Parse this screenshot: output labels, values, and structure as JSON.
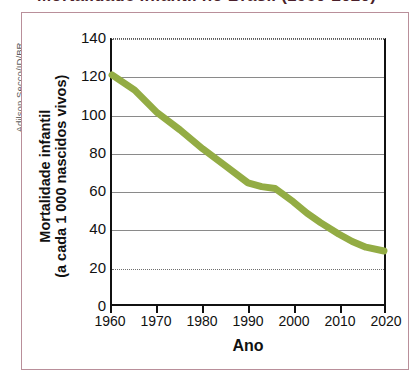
{
  "figure": {
    "credit": "Adilson Secco/ID/BR",
    "title_clipped": "Mortalidade infantil no Brasil (1960-2020)"
  },
  "chart_data": {
    "type": "line",
    "title": "Mortalidade infantil no Brasil (1960-2020)",
    "xlabel": "Ano",
    "ylabel": "Mortalidade infantil\n(a cada 1 000 nascidos vivos)",
    "ylabel_line1": "Mortalidade infantil",
    "ylabel_line2": "(a cada 1 000 nascidos vivos)",
    "xlim": [
      1960,
      2020
    ],
    "ylim": [
      0,
      140
    ],
    "grid": true,
    "legend": "none",
    "line_color": "#93AC44",
    "line_width_px": 7,
    "xticks": [
      1960,
      1970,
      1980,
      1990,
      2000,
      2010,
      2020
    ],
    "yticks": [
      0,
      20,
      40,
      60,
      80,
      100,
      120,
      140
    ],
    "x": [
      1960,
      1965,
      1970,
      1975,
      1980,
      1985,
      1990,
      1993,
      1996,
      2000,
      2003,
      2006,
      2010,
      2013,
      2016,
      2020
    ],
    "values": [
      121,
      113,
      101,
      92,
      82,
      73,
      64,
      62,
      61,
      54,
      48,
      43,
      37,
      33,
      30,
      28
    ],
    "series": [
      {
        "name": "Mortalidade infantil (a cada 1 000 nascidos vivos)",
        "values": [
          121,
          113,
          101,
          92,
          82,
          73,
          64,
          62,
          61,
          54,
          48,
          43,
          37,
          33,
          30,
          28
        ]
      }
    ]
  },
  "colors": {
    "line": "#93AC44",
    "frame": "#b98f9a",
    "axis": "#111111",
    "grid": "#8a8a8a",
    "title": "#4a1f2a"
  }
}
